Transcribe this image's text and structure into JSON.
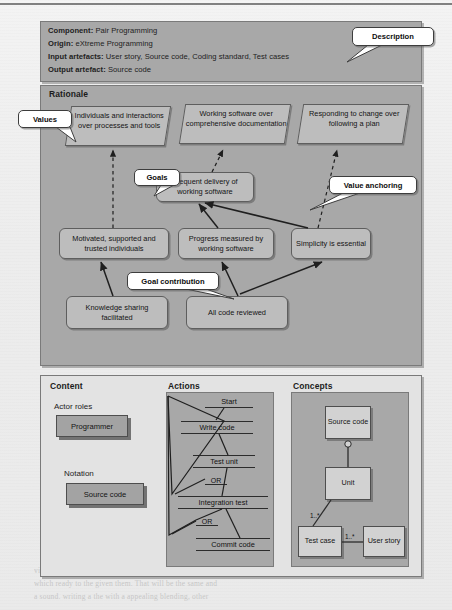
{
  "description": {
    "callout": "Description",
    "lines": [
      {
        "key": "Component:",
        "value": "Pair Programming"
      },
      {
        "key": "Origin:",
        "value": "eXtreme Programming"
      },
      {
        "key": "Input artefacts:",
        "value": "User story, Source code, Coding standard, Test cases"
      },
      {
        "key": "Output artefact:",
        "value": "Source code"
      }
    ]
  },
  "rationale": {
    "header": "Rationale",
    "callouts": {
      "values": "Values",
      "goals": "Goals",
      "value_anchoring": "Value anchoring",
      "goal_contribution": "Goal contribution"
    },
    "values": [
      "Individuals and interactions over processes and tools",
      "Working software over comprehensive documentation",
      "Responding to change over following a plan"
    ],
    "goals": [
      "Frequent delivery of working software",
      "Motivated, supported and trusted individuals",
      "Progress measured by working software",
      "Simplicity is essential"
    ],
    "contributions": [
      "Knowledge sharing facilitated",
      "All code reviewed"
    ]
  },
  "content": {
    "header": "Content",
    "actor_roles_label": "Actor roles",
    "actor_roles": [
      "Programmer"
    ],
    "notation_label": "Notation",
    "notation": [
      "Source code"
    ]
  },
  "actions": {
    "header": "Actions",
    "steps": [
      "Start",
      "Write code",
      "Test unit",
      "Integration test",
      "Commit code"
    ],
    "branch_labels": [
      "OR",
      "OR"
    ]
  },
  "concepts": {
    "header": "Concepts",
    "classes": [
      "Source code",
      "Unit",
      "Test case",
      "User story"
    ],
    "multiplicities": [
      "1..*",
      "1..*"
    ]
  },
  "colors": {
    "panel_grey": "#a8a8a8",
    "panel_light": "#e3e3e3",
    "box_grey": "#bdbdbd",
    "callout_bg": "#ffffff",
    "line": "#2c2c2c"
  },
  "ghost_text": [
    "vision a the in 2 the 1 of e the minutes in the a rather imper",
    "which ready to the given them. That will be the same and",
    "a sound. writing a the with a appealing blending, other"
  ]
}
